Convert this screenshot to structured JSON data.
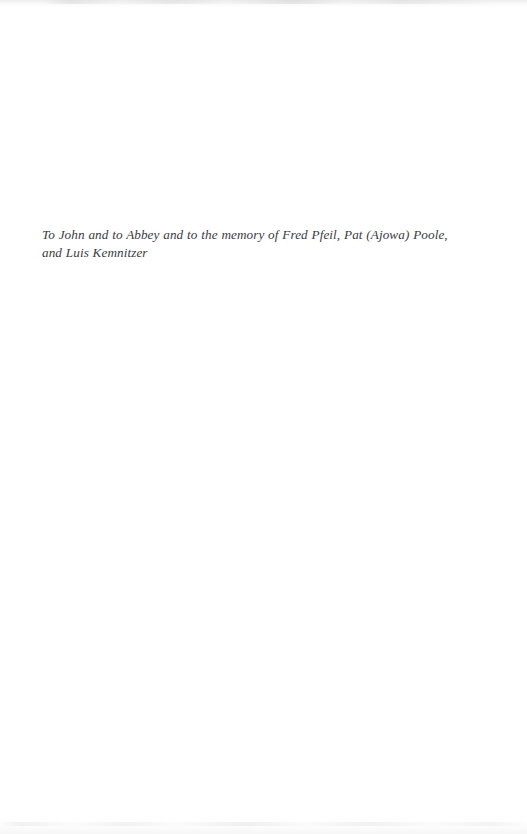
{
  "page": {
    "kind": "book-dedication-page",
    "background_color": "#ffffff",
    "width": 527,
    "height": 834
  },
  "dedication": {
    "text": "To John and to Abbey and to the memory of Fred Pfeil, Pat (Ajowa) Poole, and Luis Kemnitzer",
    "text_color": "#3b3b3f",
    "style": "italic"
  },
  "artifacts": {
    "top_edge_label": "scan-edge-smudge-top",
    "bottom_edge_label": "scan-edge-smudge-bottom"
  }
}
